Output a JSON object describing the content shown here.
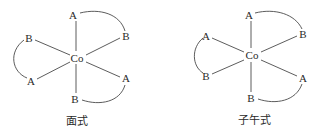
{
  "diagrams": [
    {
      "name": "fac-isomer",
      "caption": "面式",
      "center": {
        "label": "Co",
        "x": 77,
        "y": 58
      },
      "ligands": [
        {
          "label": "A",
          "x": 73,
          "y": 15
        },
        {
          "label": "B",
          "x": 29,
          "y": 38
        },
        {
          "label": "B",
          "x": 126,
          "y": 36
        },
        {
          "label": "A",
          "x": 31,
          "y": 81
        },
        {
          "label": "A",
          "x": 126,
          "y": 78
        },
        {
          "label": "B",
          "x": 75,
          "y": 99
        }
      ],
      "caption_pos": {
        "x": 77,
        "y": 121
      }
    },
    {
      "name": "mer-isomer",
      "caption": "子午式",
      "center": {
        "label": "Co",
        "x": 252,
        "y": 55
      },
      "ligands": [
        {
          "label": "A",
          "x": 249,
          "y": 15
        },
        {
          "label": "A",
          "x": 206,
          "y": 36
        },
        {
          "label": "B",
          "x": 303,
          "y": 34
        },
        {
          "label": "B",
          "x": 206,
          "y": 76
        },
        {
          "label": "A",
          "x": 303,
          "y": 78
        },
        {
          "label": "B",
          "x": 251,
          "y": 98
        }
      ],
      "caption_pos": {
        "x": 254,
        "y": 120
      }
    }
  ]
}
